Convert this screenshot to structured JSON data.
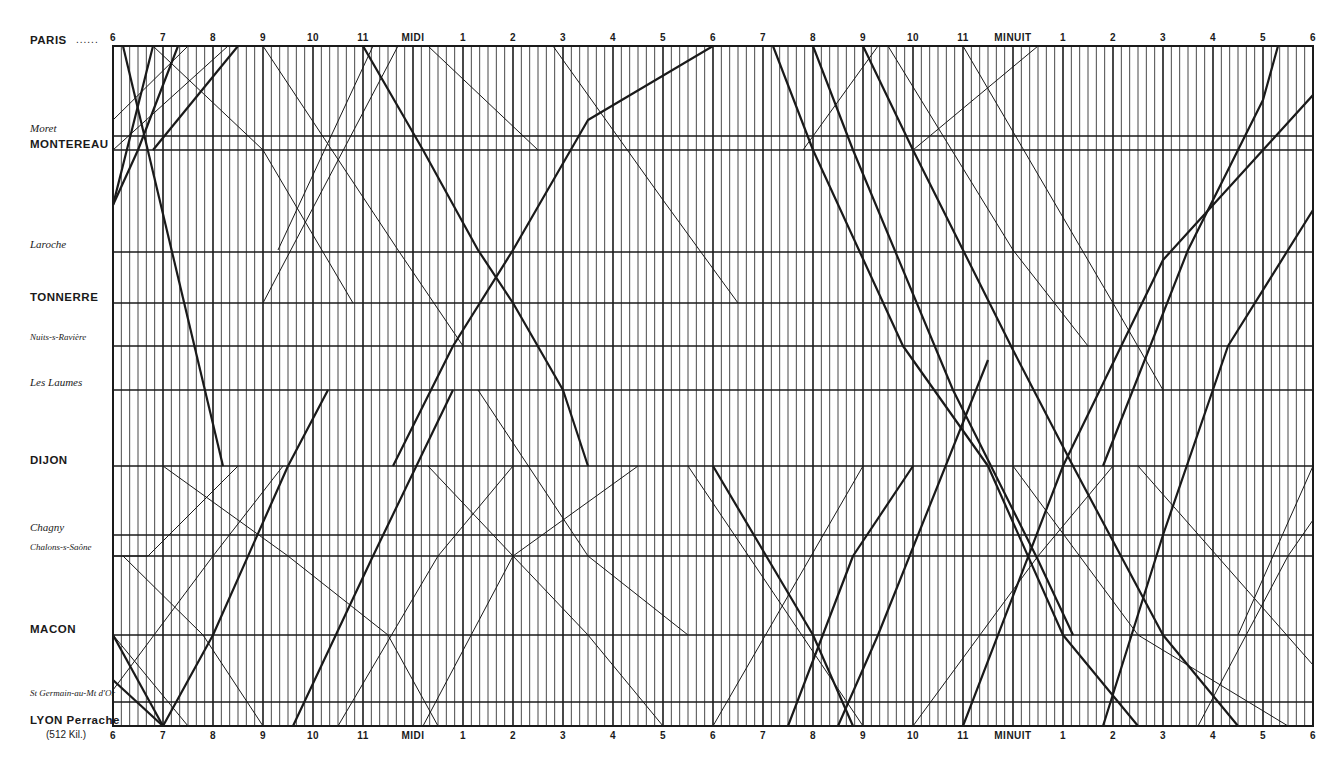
{
  "chart_data": {
    "type": "line",
    "title": "",
    "subtitle": "",
    "xlabel": "",
    "ylabel": "",
    "x_axis": {
      "start_hour": 6,
      "span_hours": 24,
      "tick_labels_top": [
        "6",
        "7",
        "8",
        "9",
        "10",
        "11",
        "MIDI",
        "1",
        "2",
        "3",
        "4",
        "5",
        "6",
        "7",
        "8",
        "9",
        "10",
        "11",
        "MINUIT",
        "1",
        "2",
        "3",
        "4",
        "5",
        "6"
      ],
      "tick_labels_bottom": [
        "6",
        "7",
        "8",
        "9",
        "10",
        "11",
        "MIDI",
        "1",
        "2",
        "3",
        "4",
        "5",
        "6",
        "7",
        "8",
        "9",
        "10",
        "11",
        "MINUIT",
        "1",
        "2",
        "3",
        "4",
        "5",
        "6"
      ],
      "minor_tick_minutes": 10
    },
    "stations": [
      {
        "name": "PARIS",
        "style": "caps",
        "y": 46,
        "suffix": "......"
      },
      {
        "name": "Moret",
        "style": "ital",
        "y": 136
      },
      {
        "name": "MONTEREAU",
        "style": "caps",
        "y": 150
      },
      {
        "name": "Laroche",
        "style": "ital",
        "y": 252
      },
      {
        "name": "TONNERRE",
        "style": "caps",
        "y": 303
      },
      {
        "name": "Nuits-s-Ravière",
        "style": "ital",
        "y": 346
      },
      {
        "name": "Les Laumes",
        "style": "ital",
        "y": 390
      },
      {
        "name": "DIJON",
        "style": "caps",
        "y": 466
      },
      {
        "name": "Chagny",
        "style": "ital",
        "y": 535
      },
      {
        "name": "Chalons-s-Saône",
        "style": "ital",
        "y": 556
      },
      {
        "name": "MACON",
        "style": "caps",
        "y": 635
      },
      {
        "name": "St Germain-au-Mt d'Or",
        "style": "ital",
        "y": 702
      },
      {
        "name": "LYON Perrache",
        "style": "caps",
        "y": 726,
        "sub": "(512 Kil.)"
      }
    ],
    "trains": [
      {
        "dir": "down",
        "weight": "thick",
        "points": [
          [
            6.0,
            205
          ],
          [
            6.8,
            46
          ]
        ]
      },
      {
        "dir": "up",
        "weight": "thick",
        "points": [
          [
            6.2,
            46
          ],
          [
            8.2,
            466
          ]
        ]
      },
      {
        "dir": "down",
        "weight": "thin",
        "points": [
          [
            6.0,
            120
          ],
          [
            7.5,
            46
          ]
        ]
      },
      {
        "dir": "down",
        "weight": "thin",
        "points": [
          [
            6.0,
            150
          ],
          [
            8.3,
            46
          ]
        ]
      },
      {
        "dir": "up",
        "weight": "thick",
        "points": [
          [
            6.8,
            150
          ],
          [
            8.5,
            46
          ]
        ]
      },
      {
        "dir": "up",
        "weight": "thick",
        "points": [
          [
            6.0,
            205
          ],
          [
            6.5,
            150
          ],
          [
            7.3,
            46
          ]
        ]
      },
      {
        "dir": "down",
        "weight": "thin",
        "points": [
          [
            6.8,
            46
          ],
          [
            9.0,
            150
          ],
          [
            10.8,
            303
          ]
        ]
      },
      {
        "dir": "down",
        "weight": "thin",
        "points": [
          [
            9.0,
            46
          ],
          [
            11.7,
            250
          ],
          [
            13.0,
            346
          ]
        ]
      },
      {
        "dir": "down",
        "weight": "thick",
        "points": [
          [
            11.0,
            46
          ],
          [
            12.2,
            150
          ],
          [
            13.3,
            250
          ],
          [
            14.0,
            303
          ],
          [
            15.0,
            390
          ],
          [
            15.5,
            466
          ]
        ]
      },
      {
        "dir": "up",
        "weight": "thick",
        "points": [
          [
            11.6,
            466
          ],
          [
            12.8,
            346
          ],
          [
            14.0,
            250
          ],
          [
            15.5,
            120
          ],
          [
            18.0,
            46
          ]
        ]
      },
      {
        "dir": "up",
        "weight": "thin",
        "points": [
          [
            9.3,
            250
          ],
          [
            11.2,
            46
          ]
        ]
      },
      {
        "dir": "up",
        "weight": "thin",
        "points": [
          [
            9.0,
            303
          ],
          [
            11.7,
            46
          ]
        ]
      },
      {
        "dir": "down",
        "weight": "thin",
        "points": [
          [
            12.3,
            46
          ],
          [
            14.5,
            150
          ]
        ]
      },
      {
        "dir": "down",
        "weight": "thin",
        "points": [
          [
            14.8,
            46
          ],
          [
            17.0,
            200
          ],
          [
            18.5,
            303
          ]
        ]
      },
      {
        "dir": "down",
        "weight": "thick",
        "points": [
          [
            19.2,
            46
          ],
          [
            20.0,
            150
          ],
          [
            21.8,
            346
          ],
          [
            23.5,
            466
          ],
          [
            25.0,
            635
          ],
          [
            26.5,
            726
          ]
        ]
      },
      {
        "dir": "down",
        "weight": "thick",
        "points": [
          [
            20.0,
            46
          ],
          [
            20.8,
            150
          ],
          [
            22.8,
            390
          ],
          [
            24.5,
            560
          ],
          [
            25.2,
            635
          ]
        ]
      },
      {
        "dir": "down",
        "weight": "thick",
        "points": [
          [
            21.0,
            46
          ],
          [
            22.0,
            150
          ],
          [
            24.0,
            350
          ],
          [
            25.2,
            466
          ],
          [
            27.0,
            635
          ],
          [
            28.5,
            726
          ]
        ]
      },
      {
        "dir": "up",
        "weight": "thick",
        "points": [
          [
            25.8,
            466
          ],
          [
            27.5,
            250
          ],
          [
            29.0,
            100
          ],
          [
            29.3,
            46
          ]
        ]
      },
      {
        "dir": "up",
        "weight": "thick",
        "points": [
          [
            23.0,
            726
          ],
          [
            25.0,
            466
          ],
          [
            27.0,
            260
          ],
          [
            29.0,
            150
          ],
          [
            30.0,
            95
          ]
        ]
      },
      {
        "dir": "up",
        "weight": "thick",
        "points": [
          [
            25.8,
            726
          ],
          [
            27.0,
            535
          ],
          [
            28.3,
            346
          ],
          [
            30.0,
            210
          ]
        ]
      },
      {
        "dir": "down",
        "weight": "thin",
        "points": [
          [
            21.5,
            46
          ],
          [
            24.0,
            250
          ],
          [
            25.5,
            346
          ]
        ]
      },
      {
        "dir": "down",
        "weight": "thin",
        "points": [
          [
            23.0,
            46
          ],
          [
            26.0,
            303
          ],
          [
            27.0,
            390
          ]
        ]
      },
      {
        "dir": "up",
        "weight": "thin",
        "points": [
          [
            22.0,
            150
          ],
          [
            24.5,
            46
          ]
        ]
      },
      {
        "dir": "up",
        "weight": "thin",
        "points": [
          [
            21.3,
            46
          ],
          [
            19.8,
            150
          ]
        ]
      },
      {
        "dir": "down",
        "weight": "thin",
        "points": [
          [
            6.0,
            635
          ],
          [
            7.5,
            726
          ]
        ]
      },
      {
        "dir": "down",
        "weight": "thick",
        "points": [
          [
            6.0,
            635
          ],
          [
            7.0,
            726
          ]
        ]
      },
      {
        "dir": "down",
        "weight": "thick",
        "points": [
          [
            6.0,
            680
          ],
          [
            7.0,
            726
          ]
        ]
      },
      {
        "dir": "up",
        "weight": "thick",
        "points": [
          [
            7.0,
            726
          ],
          [
            8.0,
            635
          ],
          [
            9.5,
            466
          ],
          [
            10.3,
            390
          ]
        ]
      },
      {
        "dir": "up",
        "weight": "thick",
        "points": [
          [
            9.6,
            726
          ],
          [
            11.2,
            556
          ],
          [
            12.8,
            390
          ]
        ]
      },
      {
        "dir": "up",
        "weight": "thin",
        "points": [
          [
            6.0,
            690
          ],
          [
            8.0,
            556
          ],
          [
            9.4,
            466
          ]
        ]
      },
      {
        "dir": "up",
        "weight": "thin",
        "points": [
          [
            6.0,
            556
          ],
          [
            6.7,
            556
          ],
          [
            8.5,
            466
          ]
        ]
      },
      {
        "dir": "down",
        "weight": "thin",
        "points": [
          [
            6.2,
            556
          ],
          [
            7.8,
            635
          ],
          [
            9.0,
            726
          ]
        ]
      },
      {
        "dir": "down",
        "weight": "thin",
        "points": [
          [
            7.0,
            466
          ],
          [
            9.5,
            556
          ],
          [
            11.5,
            635
          ],
          [
            12.5,
            726
          ]
        ]
      },
      {
        "dir": "up",
        "weight": "thin",
        "points": [
          [
            10.5,
            726
          ],
          [
            12.5,
            556
          ],
          [
            14.0,
            466
          ]
        ]
      },
      {
        "dir": "down",
        "weight": "thin",
        "points": [
          [
            12.3,
            466
          ],
          [
            14.0,
            556
          ],
          [
            15.5,
            635
          ],
          [
            17.0,
            726
          ]
        ]
      },
      {
        "dir": "up",
        "weight": "thin",
        "points": [
          [
            12.2,
            726
          ],
          [
            14.0,
            556
          ],
          [
            16.5,
            466
          ]
        ]
      },
      {
        "dir": "down",
        "weight": "thin",
        "points": [
          [
            13.3,
            390
          ],
          [
            15.5,
            556
          ],
          [
            17.5,
            635
          ]
        ]
      },
      {
        "dir": "down",
        "weight": "thick",
        "points": [
          [
            18.0,
            466
          ],
          [
            20.0,
            635
          ],
          [
            20.8,
            726
          ]
        ]
      },
      {
        "dir": "up",
        "weight": "thick",
        "points": [
          [
            19.5,
            726
          ],
          [
            20.8,
            556
          ],
          [
            22.0,
            466
          ]
        ]
      },
      {
        "dir": "up",
        "weight": "thick",
        "points": [
          [
            20.5,
            726
          ],
          [
            21.3,
            635
          ],
          [
            23.5,
            360
          ]
        ]
      },
      {
        "dir": "up",
        "weight": "thin",
        "points": [
          [
            18.0,
            726
          ],
          [
            21.0,
            466
          ]
        ]
      },
      {
        "dir": "down",
        "weight": "thin",
        "points": [
          [
            17.5,
            466
          ],
          [
            21.0,
            726
          ]
        ]
      },
      {
        "dir": "up",
        "weight": "thin",
        "points": [
          [
            22.0,
            726
          ],
          [
            24.5,
            556
          ],
          [
            26.0,
            466
          ]
        ]
      },
      {
        "dir": "down",
        "weight": "thin",
        "points": [
          [
            24.0,
            466
          ],
          [
            26.5,
            635
          ],
          [
            29.5,
            726
          ]
        ]
      },
      {
        "dir": "up",
        "weight": "thin",
        "points": [
          [
            27.7,
            726
          ],
          [
            29.5,
            556
          ],
          [
            30.0,
            520
          ]
        ]
      },
      {
        "dir": "down",
        "weight": "thin",
        "points": [
          [
            26.5,
            466
          ],
          [
            30.0,
            665
          ]
        ]
      },
      {
        "dir": "up",
        "weight": "thin",
        "points": [
          [
            28.5,
            635
          ],
          [
            30.0,
            466
          ]
        ]
      }
    ],
    "grid": true
  },
  "colors": {
    "ink": "#1a1a1a",
    "background": "#ffffff"
  }
}
